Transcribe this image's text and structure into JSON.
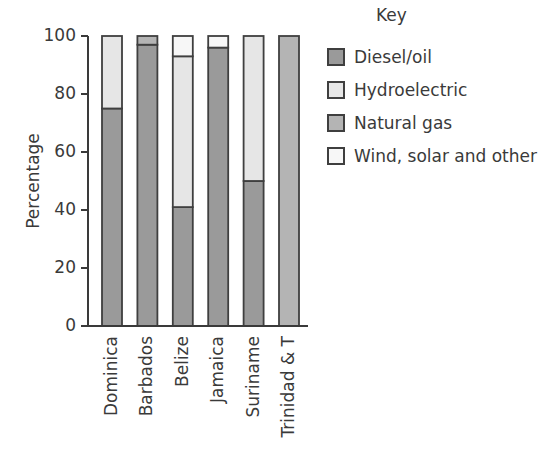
{
  "chart_data": {
    "type": "bar",
    "stacked": true,
    "title": "",
    "xlabel": "",
    "ylabel": "Percentage",
    "ylim": [
      0,
      100
    ],
    "yticks": [
      0,
      20,
      40,
      60,
      80,
      100
    ],
    "grid": false,
    "legend_title": "Key",
    "legend_position": "right",
    "categories": [
      "Dominica",
      "Barbados",
      "Belize",
      "Jamaica",
      "Suriname",
      "Trinidad & T"
    ],
    "series": [
      {
        "name": "Diesel/oil",
        "color": "#9a9a9a",
        "values": [
          75,
          97,
          41,
          96,
          50,
          0
        ]
      },
      {
        "name": "Hydroelectric",
        "color": "#e6e6e6",
        "values": [
          25,
          0,
          52,
          0,
          50,
          0
        ]
      },
      {
        "name": "Natural gas",
        "color": "#b4b4b4",
        "values": [
          0,
          3,
          0,
          0,
          0,
          100
        ]
      },
      {
        "name": "Wind, solar and other",
        "color": "#f7f7f7",
        "values": [
          0,
          0,
          7,
          4,
          0,
          0
        ]
      }
    ]
  },
  "legend": {
    "title": "Key",
    "items": [
      {
        "label": "Diesel/oil",
        "color": "#9a9a9a"
      },
      {
        "label": "Hydroelectric",
        "color": "#e6e6e6"
      },
      {
        "label": "Natural gas",
        "color": "#b4b4b4"
      },
      {
        "label": "Wind, solar and other",
        "color": "#f7f7f7"
      }
    ]
  },
  "axis": {
    "y_title": "Percentage",
    "y_ticks": [
      "0",
      "20",
      "40",
      "60",
      "80",
      "100"
    ]
  }
}
